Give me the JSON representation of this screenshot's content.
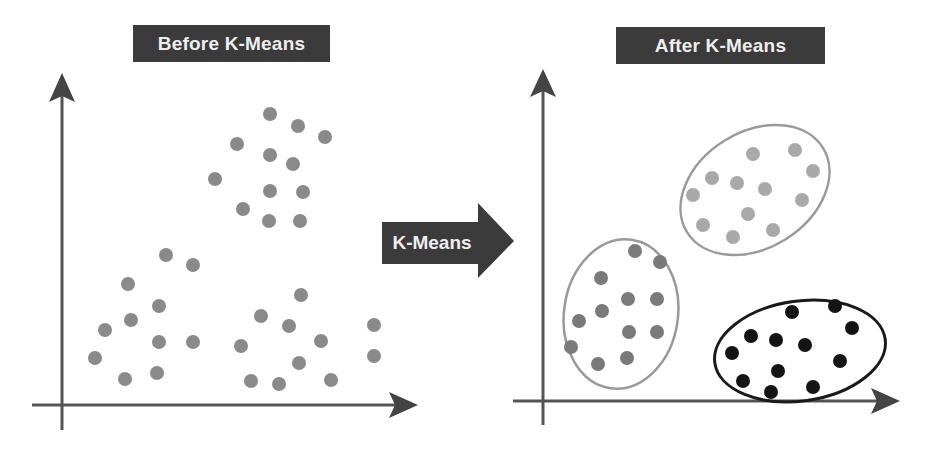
{
  "panels": {
    "before": {
      "title": "Before K-Means"
    },
    "after": {
      "title": "After K-Means"
    }
  },
  "transition_arrow": {
    "label": "K-Means"
  },
  "colors": {
    "label_bg": "#3b3b3b",
    "label_text": "#eeeeee",
    "axis": "#555555",
    "unclustered_dot": "#8a8a8a",
    "cluster_1_dot": "#a9a9a9",
    "cluster_1_outline": "#9a9a9a",
    "cluster_2_dot": "#7a7a7a",
    "cluster_2_outline": "#999999",
    "cluster_3_dot": "#141414",
    "cluster_3_outline": "#1a1a1a"
  },
  "chart_data": [
    {
      "type": "scatter",
      "title": "Before K-Means",
      "xlabel": "",
      "ylabel": "",
      "series": [
        {
          "name": "unclustered points",
          "points": [
            [
              270,
              114
            ],
            [
              298,
              126
            ],
            [
              325,
              137
            ],
            [
              237,
              144
            ],
            [
              270,
              155
            ],
            [
              293,
              164
            ],
            [
              215,
              179
            ],
            [
              270,
              191
            ],
            [
              303,
              192
            ],
            [
              243,
              209
            ],
            [
              269,
              221
            ],
            [
              300,
              221
            ],
            [
              166,
              255
            ],
            [
              193,
              265
            ],
            [
              128,
              284
            ],
            [
              159,
              306
            ],
            [
              131,
              320
            ],
            [
              105,
              330
            ],
            [
              159,
              342
            ],
            [
              193,
              342
            ],
            [
              95,
              358
            ],
            [
              125,
              379
            ],
            [
              157,
              373
            ],
            [
              301,
              295
            ],
            [
              261,
              316
            ],
            [
              289,
              326
            ],
            [
              374,
              325
            ],
            [
              241,
              346
            ],
            [
              321,
              341
            ],
            [
              374,
              356
            ],
            [
              299,
              363
            ],
            [
              251,
              381
            ],
            [
              279,
              384
            ],
            [
              331,
              380
            ]
          ]
        }
      ]
    },
    {
      "type": "scatter",
      "title": "After K-Means",
      "xlabel": "",
      "ylabel": "",
      "series": [
        {
          "name": "cluster 1 (light gray, top)",
          "ellipse": {
            "cx": 755,
            "cy": 190,
            "rx": 80,
            "ry": 58,
            "rotate": -32
          },
          "points": [
            [
              753,
              154
            ],
            [
              795,
              150
            ],
            [
              712,
              178
            ],
            [
              737,
              183
            ],
            [
              765,
              189
            ],
            [
              813,
              171
            ],
            [
              693,
              195
            ],
            [
              802,
              200
            ],
            [
              748,
              214
            ],
            [
              703,
              225
            ],
            [
              733,
              237
            ],
            [
              773,
              230
            ]
          ]
        },
        {
          "name": "cluster 2 (medium gray, left)",
          "ellipse": {
            "cx": 621,
            "cy": 314,
            "rx": 57,
            "ry": 75,
            "rotate": 8
          },
          "points": [
            [
              635,
              251
            ],
            [
              660,
              262
            ],
            [
              601,
              278
            ],
            [
              628,
              299
            ],
            [
              657,
              299
            ],
            [
              602,
              311
            ],
            [
              579,
              321
            ],
            [
              629,
              332
            ],
            [
              657,
              332
            ],
            [
              571,
              347
            ],
            [
              598,
              364
            ],
            [
              627,
              358
            ]
          ]
        },
        {
          "name": "cluster 3 (black, bottom right)",
          "ellipse": {
            "cx": 800,
            "cy": 351,
            "rx": 86,
            "ry": 50,
            "rotate": -8
          },
          "points": [
            [
              792,
              312
            ],
            [
              835,
              306
            ],
            [
              852,
              328
            ],
            [
              751,
              336
            ],
            [
              776,
              340
            ],
            [
              805,
              345
            ],
            [
              732,
              353
            ],
            [
              840,
              361
            ],
            [
              778,
              371
            ],
            [
              743,
              381
            ],
            [
              771,
              392
            ],
            [
              813,
              387
            ]
          ]
        }
      ]
    }
  ]
}
